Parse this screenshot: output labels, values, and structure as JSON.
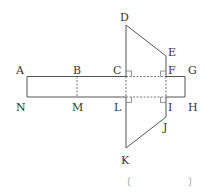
{
  "figure": {
    "labels": {
      "A": "A",
      "B": "B",
      "C": "C",
      "D": "D",
      "E": "E",
      "F": "F",
      "G": "G",
      "H": "H",
      "I": "I",
      "J": "J",
      "K": "K",
      "L": "L",
      "M": "M",
      "N": "N"
    },
    "line_color": "#555555"
  },
  "answer_bracket": {
    "open": "〔",
    "close": "〕"
  }
}
